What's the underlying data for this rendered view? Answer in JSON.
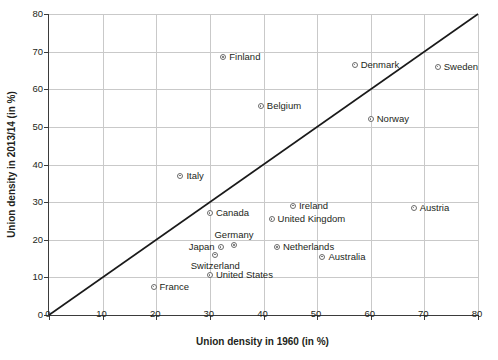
{
  "chart_data": {
    "type": "scatter",
    "title": "",
    "xlabel": "Union density in 1960 (in %)",
    "ylabel": "Union density in 2013/14 (in %)",
    "xlim": [
      0,
      80
    ],
    "ylim": [
      0,
      80
    ],
    "xticks": [
      0,
      10,
      20,
      30,
      40,
      50,
      60,
      70,
      80
    ],
    "yticks": [
      0,
      10,
      20,
      30,
      40,
      50,
      60,
      70,
      80
    ],
    "grid": true,
    "legend": "none",
    "annotations": [
      "45-degree reference line from (0,0) to (80,80)"
    ],
    "points": [
      {
        "label": "Finland",
        "x": 32.5,
        "y": 68.5,
        "label_pos": "right"
      },
      {
        "label": "Denmark",
        "x": 57.0,
        "y": 66.5,
        "label_pos": "right"
      },
      {
        "label": "Sweden",
        "x": 72.5,
        "y": 66.0,
        "label_pos": "right"
      },
      {
        "label": "Belgium",
        "x": 39.5,
        "y": 55.5,
        "label_pos": "right"
      },
      {
        "label": "Norway",
        "x": 60.0,
        "y": 52.0,
        "label_pos": "right"
      },
      {
        "label": "Italy",
        "x": 24.5,
        "y": 37.0,
        "label_pos": "right"
      },
      {
        "label": "Ireland",
        "x": 45.5,
        "y": 29.0,
        "label_pos": "right"
      },
      {
        "label": "Austria",
        "x": 68.0,
        "y": 28.5,
        "label_pos": "right"
      },
      {
        "label": "Canada",
        "x": 30.0,
        "y": 27.0,
        "label_pos": "right"
      },
      {
        "label": "United Kingdom",
        "x": 41.5,
        "y": 25.5,
        "label_pos": "right"
      },
      {
        "label": "Germany",
        "x": 34.5,
        "y": 18.5,
        "label_pos": "above"
      },
      {
        "label": "Netherlands",
        "x": 42.5,
        "y": 18.0,
        "label_pos": "right"
      },
      {
        "label": "Japan",
        "x": 32.0,
        "y": 18.0,
        "label_pos": "left"
      },
      {
        "label": "Australia",
        "x": 51.0,
        "y": 15.5,
        "label_pos": "right"
      },
      {
        "label": "Switzerland",
        "x": 31.0,
        "y": 16.0,
        "label_pos": "below"
      },
      {
        "label": "United States",
        "x": 30.0,
        "y": 10.5,
        "label_pos": "right"
      },
      {
        "label": "France",
        "x": 19.5,
        "y": 7.5,
        "label_pos": "right"
      }
    ]
  },
  "colors": {
    "axis": "#3b3b3b",
    "grid": "#c9c9c9",
    "marker": "#6b6b6b",
    "text": "#231f20",
    "background": "#ffffff"
  }
}
